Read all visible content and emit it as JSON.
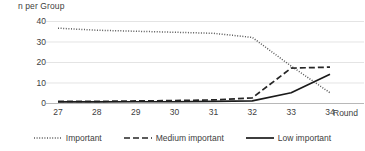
{
  "chart_data": {
    "type": "line",
    "title": "",
    "xlabel": "Round",
    "ylabel": "n per Group",
    "x": [
      27,
      28,
      29,
      30,
      31,
      32,
      33,
      34
    ],
    "xtick_labels": [
      "27",
      "28",
      "29",
      "30",
      "31",
      "32",
      "33",
      "34"
    ],
    "ytick_labels": [
      "0",
      "10",
      "20",
      "30",
      "40"
    ],
    "ytick_values": [
      0,
      10,
      20,
      30,
      40
    ],
    "ylim": [
      0,
      40
    ],
    "xlim": [
      27,
      34
    ],
    "grid": true,
    "legend_position": "bottom",
    "series": [
      {
        "name": "Important",
        "style": "dotted",
        "color": "#595959",
        "values": [
          36.5,
          35.5,
          35,
          34.5,
          34,
          32,
          18,
          5
        ]
      },
      {
        "name": "Medium important",
        "style": "dashed",
        "color": "#262626",
        "values": [
          0.8,
          0.8,
          1,
          1.2,
          1.5,
          2.5,
          17,
          17.5
        ]
      },
      {
        "name": "Low important",
        "style": "solid",
        "color": "#1a1a1a",
        "values": [
          0.5,
          0.5,
          0.6,
          0.6,
          0.8,
          1,
          5,
          14
        ]
      }
    ]
  },
  "axis": {
    "y_title": "n per Group",
    "x_title": "Round"
  },
  "legend": {
    "items": [
      {
        "label": "Important"
      },
      {
        "label": "Medium important"
      },
      {
        "label": "Low important"
      }
    ]
  },
  "colors": {
    "important": "#595959",
    "medium_important": "#262626",
    "low_important": "#1a1a1a",
    "grid": "#d9d9d9",
    "text": "#404040"
  }
}
